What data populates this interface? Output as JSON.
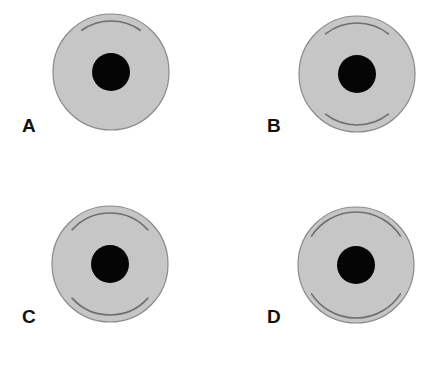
{
  "figure": {
    "width": 443,
    "height": 377,
    "colors": {
      "background": "#ffffff",
      "disc_fill": "#c6c6c6",
      "disc_stroke": "#8a8a8a",
      "pupil_fill": "#050505",
      "arc_stroke": "#6e6e6e",
      "label_color": "#111111"
    },
    "panels": [
      {
        "id": "A",
        "label": "A",
        "label_pos": {
          "x": 22,
          "y": 116
        },
        "disc": {
          "cx": 111,
          "cy": 72,
          "r": 58
        },
        "pupil": {
          "cx": 111,
          "cy": 72,
          "r": 19
        },
        "arcs": [
          {
            "position": "upper",
            "start_deg": 235,
            "end_deg": 305,
            "r": 51
          }
        ]
      },
      {
        "id": "B",
        "label": "B",
        "label_pos": {
          "x": 267,
          "y": 116
        },
        "disc": {
          "cx": 357,
          "cy": 74,
          "r": 58
        },
        "pupil": {
          "cx": 357,
          "cy": 74,
          "r": 19
        },
        "arcs": [
          {
            "position": "upper",
            "start_deg": 232,
            "end_deg": 308,
            "r": 51
          },
          {
            "position": "lower",
            "start_deg": 52,
            "end_deg": 128,
            "r": 51
          }
        ]
      },
      {
        "id": "C",
        "label": "C",
        "label_pos": {
          "x": 22,
          "y": 307
        },
        "disc": {
          "cx": 110,
          "cy": 264,
          "r": 58
        },
        "pupil": {
          "cx": 110,
          "cy": 264,
          "r": 19
        },
        "arcs": [
          {
            "position": "upper",
            "start_deg": 222,
            "end_deg": 318,
            "r": 51
          },
          {
            "position": "lower",
            "start_deg": 42,
            "end_deg": 138,
            "r": 51
          }
        ]
      },
      {
        "id": "D",
        "label": "D",
        "label_pos": {
          "x": 267,
          "y": 307
        },
        "disc": {
          "cx": 356,
          "cy": 265,
          "r": 58
        },
        "pupil": {
          "cx": 356,
          "cy": 265,
          "r": 19
        },
        "arcs": [
          {
            "position": "upper",
            "start_deg": 213,
            "end_deg": 327,
            "r": 53
          },
          {
            "position": "lower",
            "start_deg": 33,
            "end_deg": 147,
            "r": 53
          }
        ]
      }
    ]
  }
}
